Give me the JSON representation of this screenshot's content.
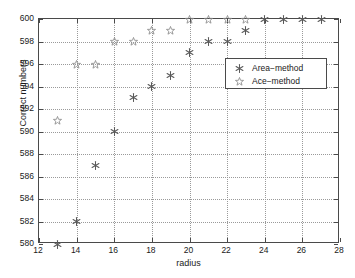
{
  "chart_data": {
    "type": "scatter",
    "title": "",
    "xlabel": "radius",
    "ylabel": "Correct numbers",
    "xlim": [
      12,
      28
    ],
    "ylim": [
      580,
      600
    ],
    "xticks": [
      12,
      14,
      16,
      18,
      20,
      22,
      24,
      26,
      28
    ],
    "yticks": [
      580,
      582,
      584,
      586,
      588,
      590,
      592,
      594,
      596,
      598,
      600
    ],
    "grid": true,
    "legend_position": "center-right",
    "series": [
      {
        "name": "Area-method",
        "marker": "filled-hexagram",
        "color": "#595959",
        "x": [
          13,
          14,
          15,
          16,
          17,
          18,
          19,
          20,
          21,
          22,
          23,
          24,
          25,
          26,
          27
        ],
        "y": [
          580,
          582,
          587,
          590,
          593,
          594,
          595,
          597,
          598,
          598,
          599,
          600,
          600,
          600,
          600
        ]
      },
      {
        "name": "Ace-method",
        "marker": "open-star",
        "color": "#8c8c8c",
        "x": [
          13,
          14,
          15,
          16,
          17,
          18,
          19,
          20,
          21,
          22,
          23
        ],
        "y": [
          591,
          596,
          596,
          598,
          598,
          599,
          599,
          600,
          600,
          600,
          600
        ]
      }
    ]
  },
  "axes": {
    "x_title": "radius",
    "y_title": "Correct numbers",
    "x_tick_labels": [
      "12",
      "14",
      "16",
      "18",
      "20",
      "22",
      "24",
      "26",
      "28"
    ],
    "y_tick_labels": [
      "580",
      "582",
      "584",
      "586",
      "588",
      "590",
      "592",
      "594",
      "596",
      "598",
      "600"
    ]
  },
  "legend": {
    "entries": [
      {
        "label": "Area−method",
        "marker": "filled-hexagram"
      },
      {
        "label": "Ace−method",
        "marker": "open-star"
      }
    ]
  },
  "colors": {
    "axis": "#4a4a4a",
    "grid": "#9a9a9a",
    "area_method": "#595959",
    "ace_method": "#8c8c8c",
    "background": "#ffffff"
  }
}
